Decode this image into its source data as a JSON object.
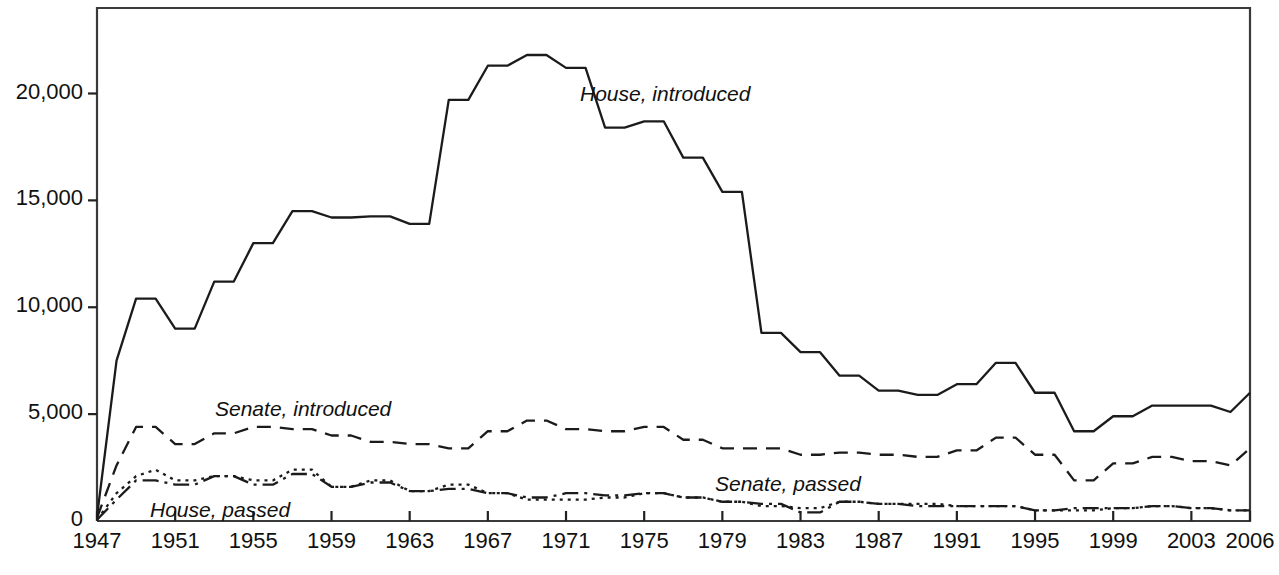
{
  "chart_data": {
    "type": "line",
    "title": "Legislative Measures Introduced and Passed, 1947-2006",
    "xlabel": "",
    "ylabel": "",
    "xlim": [
      1947,
      2006
    ],
    "ylim": [
      0,
      24000
    ],
    "grid": false,
    "legend_position": "inline-annotations",
    "x_tick_labels": [
      "1947",
      "1951",
      "1955",
      "1959",
      "1963",
      "1967",
      "1971",
      "1975",
      "1979",
      "1983",
      "1987",
      "1991",
      "1995",
      "1999",
      "2003",
      "2006"
    ],
    "y_tick_labels": [
      "0",
      "5,000",
      "10,000",
      "15,000",
      "20,000"
    ],
    "y_ticks": [
      0,
      5000,
      10000,
      15000,
      20000
    ],
    "x": [
      1947,
      1948,
      1949,
      1950,
      1951,
      1952,
      1953,
      1954,
      1955,
      1956,
      1957,
      1958,
      1959,
      1960,
      1961,
      1962,
      1963,
      1964,
      1965,
      1966,
      1967,
      1968,
      1969,
      1970,
      1971,
      1972,
      1973,
      1974,
      1975,
      1976,
      1977,
      1978,
      1979,
      1980,
      1981,
      1982,
      1983,
      1984,
      1985,
      1986,
      1987,
      1988,
      1989,
      1990,
      1991,
      1992,
      1993,
      1994,
      1995,
      1996,
      1997,
      1998,
      1999,
      2000,
      2001,
      2002,
      2003,
      2004,
      2005,
      2006
    ],
    "series": [
      {
        "name": "House, introduced",
        "style": "solid",
        "label_x": 580,
        "label_y": 82,
        "values": [
          200,
          7500,
          10400,
          10400,
          9000,
          9000,
          11200,
          11200,
          13000,
          13000,
          14500,
          14500,
          14200,
          14200,
          14250,
          14250,
          13900,
          13900,
          19700,
          19700,
          21300,
          21300,
          21800,
          21800,
          21200,
          21200,
          18400,
          18400,
          18700,
          18700,
          17000,
          17000,
          15400,
          15400,
          8800,
          8800,
          7900,
          7900,
          6800,
          6800,
          6100,
          6100,
          5900,
          5900,
          6400,
          6400,
          7400,
          7400,
          6000,
          6000,
          4200,
          4200,
          4900,
          4900,
          5400,
          5400,
          5400,
          5400,
          5100,
          6000
        ]
      },
      {
        "name": "Senate, introduced",
        "style": "dashed",
        "label_x": 215,
        "label_y": 397,
        "values": [
          150,
          2600,
          4400,
          4400,
          3600,
          3600,
          4100,
          4100,
          4400,
          4400,
          4300,
          4300,
          4000,
          4000,
          3700,
          3700,
          3600,
          3600,
          3400,
          3400,
          4200,
          4200,
          4700,
          4700,
          4300,
          4300,
          4200,
          4200,
          4400,
          4400,
          3800,
          3800,
          3400,
          3400,
          3400,
          3400,
          3100,
          3100,
          3200,
          3200,
          3100,
          3100,
          3000,
          3000,
          3300,
          3300,
          3900,
          3900,
          3100,
          3100,
          1900,
          1900,
          2700,
          2700,
          3000,
          3000,
          2800,
          2800,
          2600,
          3400
        ]
      },
      {
        "name": "House, passed",
        "style": "dotted",
        "label_x": 150,
        "label_y": 498,
        "values": [
          60,
          1300,
          2100,
          2400,
          1900,
          1900,
          2100,
          2100,
          1900,
          1900,
          2400,
          2400,
          1600,
          1600,
          1900,
          1900,
          1400,
          1400,
          1700,
          1700,
          1300,
          1300,
          1000,
          1000,
          1000,
          1000,
          1100,
          1100,
          1300,
          1300,
          1100,
          1100,
          900,
          900,
          700,
          700,
          600,
          600,
          900,
          900,
          800,
          800,
          800,
          800,
          700,
          700,
          700,
          700,
          500,
          500,
          500,
          500,
          600,
          600,
          700,
          700,
          600,
          600,
          500,
          500
        ]
      },
      {
        "name": "Senate, passed",
        "style": "dashdot",
        "label_x": 715,
        "label_y": 472,
        "values": [
          60,
          1000,
          1900,
          1900,
          1700,
          1700,
          2100,
          2100,
          1700,
          1700,
          2200,
          2200,
          1600,
          1600,
          1800,
          1800,
          1400,
          1400,
          1500,
          1500,
          1300,
          1300,
          1100,
          1100,
          1300,
          1300,
          1200,
          1200,
          1300,
          1300,
          1100,
          1100,
          900,
          900,
          800,
          800,
          400,
          400,
          900,
          900,
          800,
          800,
          700,
          700,
          700,
          700,
          700,
          700,
          500,
          500,
          600,
          600,
          600,
          600,
          700,
          700,
          600,
          600,
          500,
          500
        ]
      }
    ]
  },
  "axes": {
    "frame_left": 97,
    "frame_right": 1250,
    "frame_top": 8,
    "frame_bottom": 521
  }
}
